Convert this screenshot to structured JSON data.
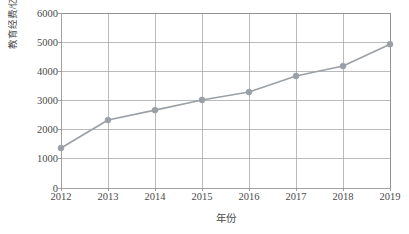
{
  "chart_data": {
    "type": "line",
    "title": "",
    "subtitle": "",
    "xlabel": "年份",
    "ylabel": "教育经费/亿元",
    "categories": [
      "2012",
      "2013",
      "2014",
      "2015",
      "2016",
      "2017",
      "2018",
      "2019"
    ],
    "x": [
      2012,
      2013,
      2014,
      2015,
      2016,
      2017,
      2018,
      2019
    ],
    "values": [
      1370,
      2330,
      2670,
      3020,
      3290,
      3840,
      4180,
      4930
    ],
    "series": [
      {
        "name": "教育经费",
        "values": [
          1370,
          2330,
          2670,
          3020,
          3290,
          3840,
          4180,
          4930
        ]
      }
    ],
    "xlim": [
      2012,
      2019
    ],
    "ylim": [
      0,
      6000
    ],
    "ytick_labels": [
      "0",
      "1000",
      "2000",
      "3000",
      "4000",
      "5000",
      "6000"
    ],
    "ytick_values": [
      0,
      1000,
      2000,
      3000,
      4000,
      5000,
      6000
    ],
    "xtick_labels": [
      "2012",
      "2013",
      "2014",
      "2015",
      "2016",
      "2017",
      "2018",
      "2019"
    ],
    "grid": true,
    "grid_axes": "both",
    "legend": "none",
    "marker": "circle",
    "line_color": "#9aa0a6",
    "marker_color": "#9aa0a6",
    "grid_color": "#9e9e9e",
    "axis_color": "#8a8a8a",
    "background_color": "#ffffff",
    "text_color": "#4a4a4a"
  }
}
